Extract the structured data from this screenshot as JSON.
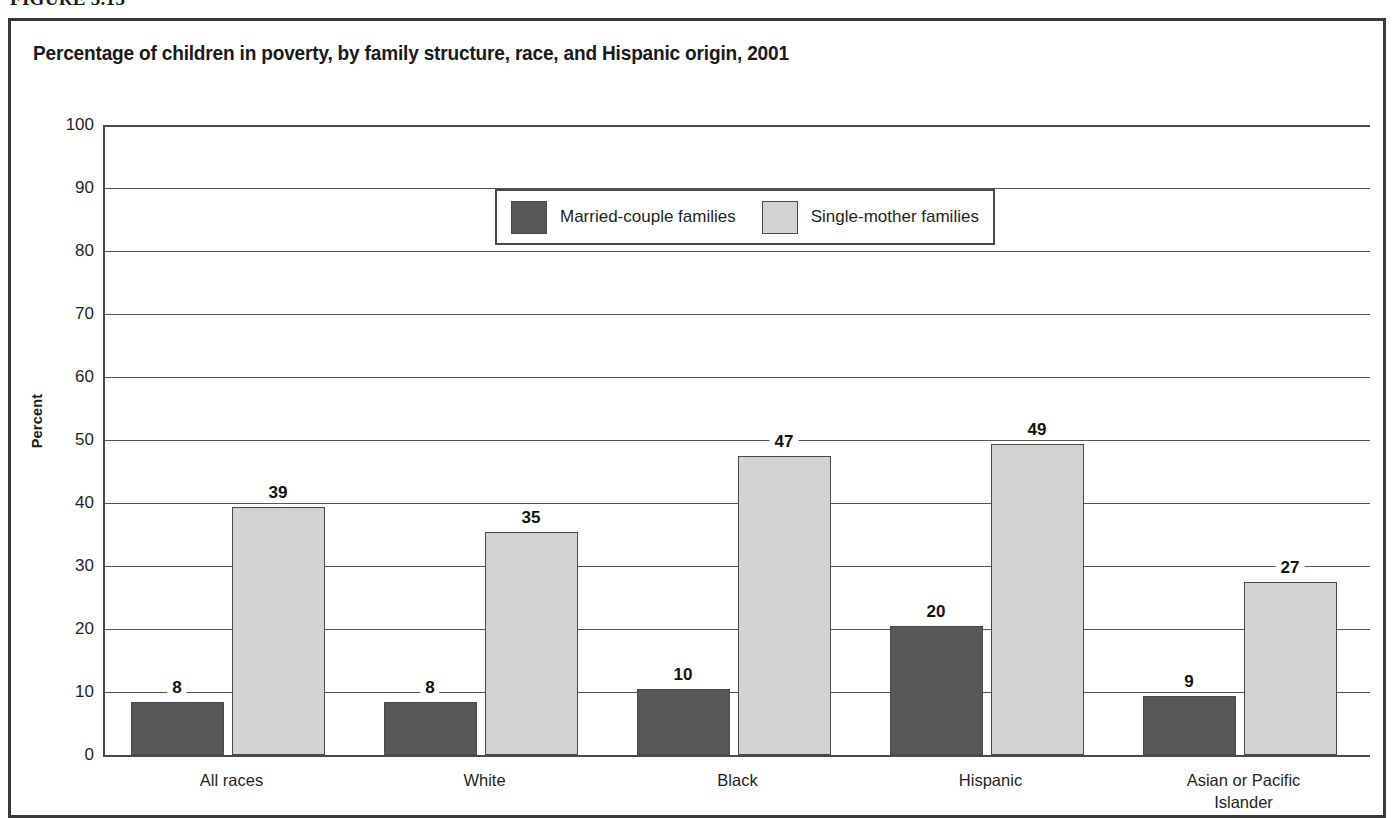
{
  "figure": {
    "label": "FIGURE 3.13"
  },
  "chart_data": {
    "type": "bar",
    "title": "Percentage of children in poverty, by family structure, race, and Hispanic origin, 2001",
    "xlabel": "",
    "ylabel": "Percent",
    "ylim": [
      0,
      100
    ],
    "ytick_step": 10,
    "yticks": [
      "100",
      "90",
      "80",
      "70",
      "60",
      "50",
      "40",
      "30",
      "20",
      "10",
      "0"
    ],
    "grid": true,
    "legend_position": "upper-center-inside",
    "categories": [
      "All races",
      "White",
      "Black",
      "Hispanic",
      "Asian or Pacific Islander"
    ],
    "category_lines": [
      [
        "All races"
      ],
      [
        "White"
      ],
      [
        "Black"
      ],
      [
        "Hispanic"
      ],
      [
        "Asian or Pacific",
        "Islander"
      ]
    ],
    "series": [
      {
        "name": "Married-couple families",
        "color": "#585858",
        "values": [
          8,
          8,
          10,
          20,
          9
        ],
        "labels": [
          "8",
          "8",
          "10",
          "20",
          "9"
        ]
      },
      {
        "name": "Single-mother families",
        "color": "#d2d2d2",
        "values": [
          39,
          35,
          47,
          49,
          27
        ],
        "labels": [
          "39",
          "35",
          "47",
          "49",
          "27"
        ]
      }
    ]
  },
  "colors": {
    "married_fill": "#585858",
    "single_fill": "#d2d2d2",
    "outline": "#4a4a4a",
    "text": "#1a1a1a",
    "background": "#ffffff"
  }
}
